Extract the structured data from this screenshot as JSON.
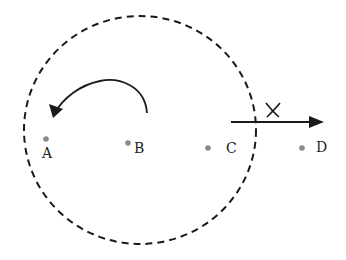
{
  "diagram": {
    "colors": {
      "stroke": "#1a1a1a",
      "point": "#8a8a8a",
      "background": "#ffffff"
    },
    "boundary": {
      "style": "dashed",
      "cx": 140,
      "cy": 130,
      "rx": 116,
      "ry": 114
    },
    "points": [
      {
        "id": "A",
        "label": "A",
        "x": 46,
        "y": 139
      },
      {
        "id": "B",
        "label": "B",
        "x": 128,
        "y": 143
      },
      {
        "id": "C",
        "label": "C",
        "x": 208,
        "y": 148
      },
      {
        "id": "D",
        "label": "D",
        "x": 302,
        "y": 148
      }
    ],
    "curved_arrow": {
      "direction": "counter-clockwise",
      "from": [
        147,
        113
      ],
      "to": [
        55,
        112
      ]
    },
    "straight_arrow": {
      "from": [
        231,
        122
      ],
      "to": [
        320,
        122
      ],
      "mark": "X"
    }
  }
}
